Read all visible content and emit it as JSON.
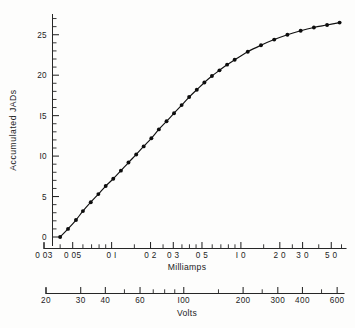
{
  "figure": {
    "background_color": "#fdfdfc",
    "ink_color": "#111111"
  },
  "chart_data": {
    "type": "line",
    "title": "",
    "subtitle": "",
    "xlabel": "Milliamps",
    "ylabel": "Accumulated JADs",
    "secondary_xlabel": "Volts",
    "xscale": "log",
    "yscale": "linear",
    "xlim": [
      0.03,
      6.5
    ],
    "ylim": [
      0,
      27.5
    ],
    "secondary_xlim": [
      20,
      650
    ],
    "grid": false,
    "legend": null,
    "marker": "filled-circle",
    "x_tick_labels": [
      "0 03",
      "0 05",
      "0 I",
      "0 2",
      "0 3",
      "0 5",
      "I 0",
      "2 0",
      "3 0",
      "5 0"
    ],
    "x_tick_values": [
      0.03,
      0.05,
      0.1,
      0.2,
      0.3,
      0.5,
      1.0,
      2.0,
      3.0,
      5.0
    ],
    "x_minor_tick_values": [
      0.04,
      0.06,
      0.07,
      0.08,
      0.09,
      0.15,
      0.25,
      0.35,
      0.4,
      0.45,
      0.6,
      0.7,
      0.8,
      0.9,
      1.5,
      2.5,
      4.0,
      6.0
    ],
    "y_tick_labels": [
      "0",
      "5",
      "I0",
      "I5",
      "20",
      "25"
    ],
    "y_tick_values": [
      0,
      5,
      10,
      15,
      20,
      25
    ],
    "y_minor_step": 1,
    "secondary_x_tick_labels": [
      "20",
      "30",
      "40",
      "60",
      "I00",
      "200",
      "300",
      "400",
      "600"
    ],
    "secondary_x_tick_values": [
      20,
      30,
      40,
      60,
      100,
      200,
      300,
      400,
      600
    ],
    "secondary_x_minor_tick_values": [
      50,
      70,
      80,
      90,
      150,
      250,
      500
    ],
    "x": [
      0.04,
      0.046,
      0.053,
      0.06,
      0.069,
      0.079,
      0.09,
      0.103,
      0.118,
      0.135,
      0.155,
      0.177,
      0.203,
      0.232,
      0.266,
      0.304,
      0.348,
      0.398,
      0.456,
      0.522,
      0.597,
      0.683,
      0.782,
      0.895,
      1.13,
      1.43,
      1.81,
      2.29,
      2.9,
      3.67,
      4.64,
      5.8
    ],
    "y": [
      0.0,
      1.0,
      2.1,
      3.2,
      4.3,
      5.3,
      6.3,
      7.2,
      8.2,
      9.2,
      10.2,
      11.2,
      12.2,
      13.3,
      14.3,
      15.3,
      16.3,
      17.3,
      18.2,
      19.1,
      19.9,
      20.6,
      21.3,
      21.9,
      22.9,
      23.7,
      24.4,
      25.0,
      25.5,
      25.9,
      26.2,
      26.5
    ],
    "series": [
      {
        "name": "Accumulated JADs",
        "values": [
          0.0,
          1.0,
          2.1,
          3.2,
          4.3,
          5.3,
          6.3,
          7.2,
          8.2,
          9.2,
          10.2,
          11.2,
          12.2,
          13.3,
          14.3,
          15.3,
          16.3,
          17.3,
          18.2,
          19.1,
          19.9,
          20.6,
          21.3,
          21.9,
          22.9,
          23.7,
          24.4,
          25.0,
          25.5,
          25.9,
          26.2,
          26.5
        ]
      }
    ]
  }
}
